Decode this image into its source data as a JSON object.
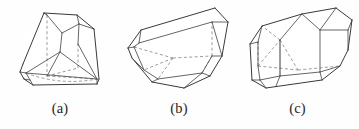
{
  "plate": {
    "name": "crystal-habit-figure-plate",
    "background_color": "#fefefe",
    "line_color": "#3a3a3a",
    "hidden_line_color": "#8a8a8a",
    "caption_color": "#232323",
    "width": 359,
    "height": 129
  },
  "figures": [
    {
      "id": "a",
      "caption": "(a)",
      "description": "tapered truncated pyramidal crystal with beveled base and hidden dashed edges",
      "hidden_edges": true
    },
    {
      "id": "b",
      "caption": "(b)",
      "description": "elongated tilted prismatic crystal with hexagonal terminal face and hidden dashed edges",
      "hidden_edges": true
    },
    {
      "id": "c",
      "caption": "(c)",
      "description": "elongated prismatic crystal with divided prism faces and hidden dashed edges",
      "hidden_edges": true
    }
  ]
}
